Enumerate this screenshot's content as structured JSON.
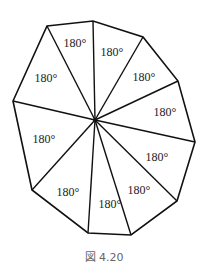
{
  "figure": {
    "caption": "図 4.20",
    "center": [
      95,
      120
    ],
    "vertices": [
      [
        47,
        26
      ],
      [
        93,
        21
      ],
      [
        143,
        37
      ],
      [
        178,
        81
      ],
      [
        195,
        142
      ],
      [
        177,
        201
      ],
      [
        131,
        235
      ],
      [
        88,
        233
      ],
      [
        32,
        190
      ],
      [
        13,
        101
      ]
    ],
    "labels": [
      {
        "text": "180°",
        "x": 75,
        "y": 47
      },
      {
        "text": "180°",
        "x": 112,
        "y": 56
      },
      {
        "text": "180°",
        "x": 144,
        "y": 81
      },
      {
        "text": "180°",
        "x": 165,
        "y": 116
      },
      {
        "text": "180°",
        "x": 157,
        "y": 161
      },
      {
        "text": "180°",
        "x": 139,
        "y": 194
      },
      {
        "text": "180°",
        "x": 110,
        "y": 208
      },
      {
        "text": "180°",
        "x": 68,
        "y": 196
      },
      {
        "text": "180°",
        "x": 44,
        "y": 143
      },
      {
        "text": "180°",
        "x": 46,
        "y": 82
      }
    ],
    "stroke_color": "#111111"
  }
}
